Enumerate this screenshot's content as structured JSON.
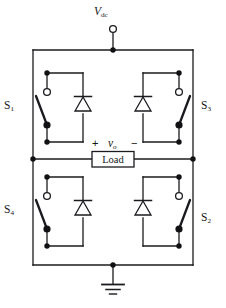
{
  "diagram": {
    "source_label": "V",
    "source_label_sub": "dc",
    "load_label": "Load",
    "output_voltage_symbol": "v",
    "output_voltage_sub": "o",
    "polarity_positive": "+",
    "polarity_negative": "−",
    "ground_name": "ground-symbol"
  },
  "switches": [
    {
      "id": "S1",
      "letter": "S",
      "number": "1",
      "position": "top-left",
      "label": "S₁"
    },
    {
      "id": "S3",
      "letter": "S",
      "number": "3",
      "position": "top-right",
      "label": "S₃"
    },
    {
      "id": "S4",
      "letter": "S",
      "number": "4",
      "position": "bottom-left",
      "label": "S₄"
    },
    {
      "id": "S2",
      "letter": "S",
      "number": "2",
      "position": "bottom-right",
      "label": "S₂"
    }
  ],
  "diodes": [
    {
      "id": "D1",
      "position": "top-left",
      "orientation": "cathode-up"
    },
    {
      "id": "D3",
      "position": "top-right",
      "orientation": "cathode-up"
    },
    {
      "id": "D4",
      "position": "bottom-left",
      "orientation": "cathode-up"
    },
    {
      "id": "D2",
      "position": "bottom-right",
      "orientation": "cathode-up"
    }
  ],
  "colors": {
    "wire": "#1b1b1f",
    "background": "#ffffff",
    "text": "#16161a",
    "node_fill": "#111114",
    "terminal_fill": "#ffffff"
  },
  "geometry": {
    "line_width": 1.3,
    "node_radius": 2.6,
    "terminal_radius": 3.2
  }
}
